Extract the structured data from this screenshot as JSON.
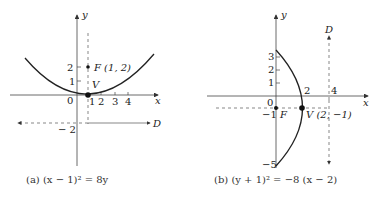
{
  "figure_a": {
    "caption": "(a)  (x − 1)² = 8y",
    "caption_prefix": "(a)",
    "equation": "(x − 1)² = 8y",
    "axis_x_label": "x",
    "axis_y_label": "y",
    "origin_label": "0",
    "x_ticks": [
      "1",
      "2",
      "3",
      "4"
    ],
    "y_ticks": [
      "1",
      "2"
    ],
    "neg_tick": "− 2",
    "focus_label": "F (1, 2)",
    "vertex_label": "V",
    "directrix_label": "D",
    "vertex": [
      1,
      0
    ],
    "focus": [
      1,
      2
    ],
    "directrix": "y = −2"
  },
  "figure_b": {
    "caption": "(b)  (y + 1)² = −8 (x − 2)",
    "caption_prefix": "(b)",
    "equation": "(y + 1)² = −8 (x − 2)",
    "axis_x_label": "x",
    "axis_y_label": "y",
    "origin_label": "0",
    "x_ticks": [
      "2",
      "4"
    ],
    "y_ticks": [
      "1",
      "2",
      "3"
    ],
    "neg_ticks": [
      "−1",
      "−5"
    ],
    "focus_label": "F",
    "vertex_label": "V (2, −1)",
    "directrix_label": "D",
    "vertex": [
      2,
      -1
    ],
    "focus": [
      0,
      -1
    ],
    "directrix": "x = 4"
  },
  "colors": {
    "ink": "#222222",
    "axis": "#444444",
    "dashed": "#555555"
  }
}
